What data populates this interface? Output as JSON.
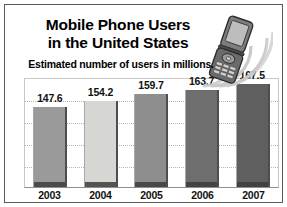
{
  "chart_data": {
    "type": "bar",
    "title": "Mobile Phone Users in the United States",
    "title_lines": [
      "Mobile Phone Users",
      "in the United States"
    ],
    "subtitle": "Estimated number of users in millions.",
    "xlabel": "",
    "ylabel": "",
    "categories": [
      "2003",
      "2004",
      "2005",
      "2006",
      "2007"
    ],
    "values": [
      147.6,
      154.2,
      159.7,
      163.7,
      167.5
    ],
    "value_labels": [
      "147.6",
      "154.2",
      "159.7",
      "163.7",
      "167.5"
    ],
    "bar_colors": [
      "#9a9a9a",
      "#d6d6d2",
      "#8e8e8e",
      "#6e6e6e",
      "#5f5f5f"
    ],
    "bar_heights_pct": [
      74,
      80,
      86,
      90,
      95
    ],
    "ylim": [
      0,
      176
    ],
    "grid": true,
    "gridlines": 4,
    "legend": "none"
  },
  "decor": {
    "phone_icon": "flip-phone-icon",
    "signal_arcs_icon": "signal-arcs-icon"
  },
  "colors": {
    "frame": "#5a5a5a",
    "grid": "#b4b4b4",
    "axis": "#8f8f8f",
    "text": "#000000",
    "background": "#ffffff"
  }
}
